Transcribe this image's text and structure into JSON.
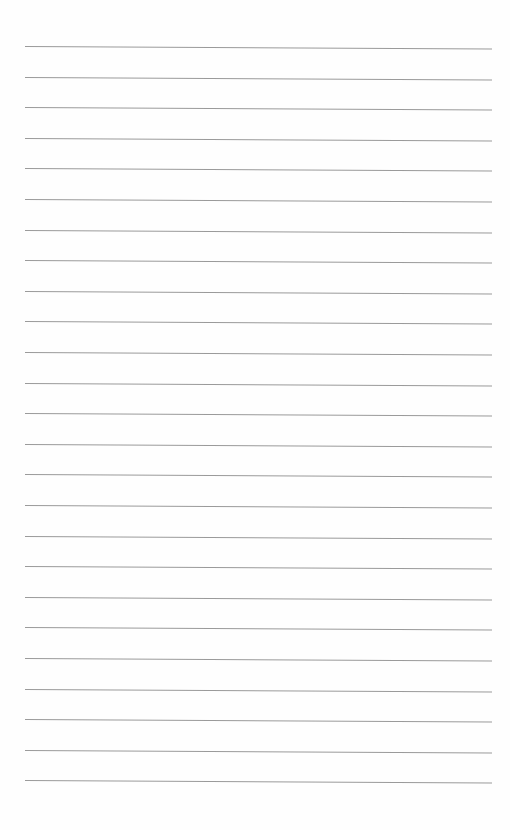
{
  "page": {
    "type": "lined-paper",
    "background_color": "#fefefe",
    "line_color": "#9a9a9a",
    "line_count": 25,
    "first_line_y": 46,
    "line_spacing": 30.6,
    "line_left_x": 25,
    "line_right_x": 492,
    "text_content": []
  }
}
